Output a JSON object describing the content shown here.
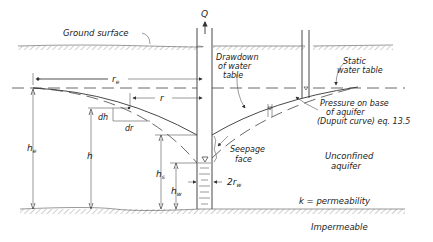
{
  "diagram": {
    "labels": {
      "discharge": "Q",
      "ground_surface": "Ground surface",
      "radius_influence": "r",
      "radius_influence_sub": "e",
      "radius": "r",
      "drawdown": [
        "Drawdown",
        "of water",
        "table"
      ],
      "static_water_table": [
        "Static",
        "water table"
      ],
      "pressure_base": [
        "Pressure on base",
        "of aquifer",
        "(Dupuit curve) eq. 13.5"
      ],
      "dh": "dh",
      "dr": "dr",
      "he": "h",
      "he_sub": "e",
      "h": "h",
      "hs": "h",
      "hs_sub": "s",
      "hw": "h",
      "hw_sub": "w",
      "seepage_face": [
        "Seepage",
        "face"
      ],
      "well_diameter": "2r",
      "well_diameter_sub": "w",
      "aquifer_type": [
        "Unconfined",
        "aquifer"
      ],
      "permeability": "k = permeability",
      "impermeable": "Impermeable"
    },
    "colors": {
      "line": "#333333",
      "background": "#ffffff"
    }
  }
}
